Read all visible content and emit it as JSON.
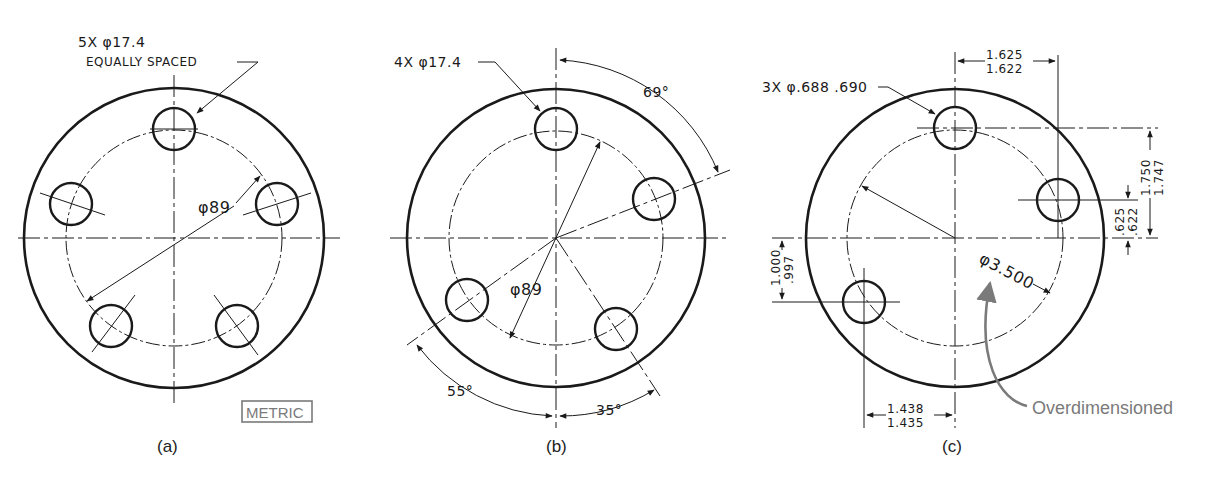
{
  "figures": {
    "a": {
      "caption": "(a)",
      "hole_callout_line1": "5X φ17.4",
      "hole_callout_line2": "EQUALLY SPACED",
      "bolt_circle": "φ89",
      "units_label": "METRIC"
    },
    "b": {
      "caption": "(b)",
      "hole_callout": "4X φ17.4",
      "bolt_circle": "φ89",
      "angle_1": "69°",
      "angle_2": "55°",
      "angle_3": "35°"
    },
    "c": {
      "caption": "(c)",
      "hole_callout": "3X φ.688 .690",
      "bolt_circle": "φ3.500",
      "top_dim_upper": "1.625",
      "top_dim_lower": "1.622",
      "right_dim_upper": "1.750",
      "right_dim_lower": "1.747",
      "right_small_upper": ".625",
      "right_small_lower": ".622",
      "left_dim_upper": "1.000",
      "left_dim_lower": ".997",
      "bottom_dim_upper": "1.438",
      "bottom_dim_lower": "1.435",
      "annotation": "Overdimensioned"
    }
  }
}
